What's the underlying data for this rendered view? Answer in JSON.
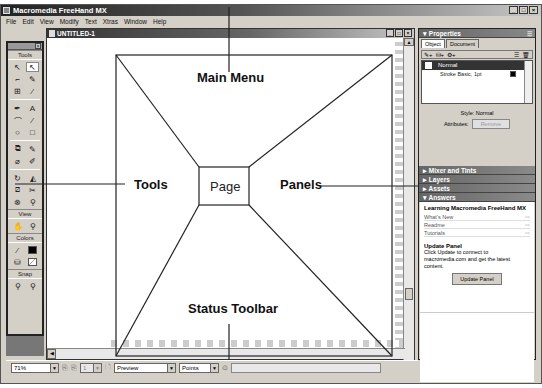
{
  "app": {
    "title": "Macromedia FreeHand MX",
    "window_buttons": [
      "_",
      "□",
      "×"
    ]
  },
  "menu": {
    "items": [
      "File",
      "Edit",
      "View",
      "Modify",
      "Text",
      "Xtras",
      "Window",
      "Help"
    ]
  },
  "document": {
    "title": "UNTITLED-1",
    "window_buttons": [
      "_",
      "□",
      "×"
    ]
  },
  "tools_panel": {
    "title": "Tools",
    "sections": [
      {
        "title": "Tools",
        "buttons": [
          {
            "icon": "pointer-icon",
            "glyph": "↖"
          },
          {
            "icon": "subselect-icon",
            "glyph": "⇱",
            "selected": true
          },
          {
            "icon": "page-tool-icon",
            "glyph": "⌐"
          },
          {
            "icon": "lasso-icon",
            "glyph": "✎"
          },
          {
            "icon": "scale-icon",
            "glyph": "⊞"
          },
          {
            "icon": "eyedropper-icon",
            "glyph": "⁄"
          },
          {
            "icon": "pen-icon",
            "glyph": "✒"
          },
          {
            "icon": "text-icon",
            "glyph": "A"
          },
          {
            "icon": "bezigon-icon",
            "glyph": "⌒"
          },
          {
            "icon": "line-icon",
            "glyph": "⁄"
          },
          {
            "icon": "ellipse-icon",
            "glyph": "○"
          },
          {
            "icon": "rectangle-icon",
            "glyph": "□"
          },
          {
            "icon": "trace-icon",
            "glyph": "⧉"
          },
          {
            "icon": "freeform-icon",
            "glyph": "✎"
          },
          {
            "icon": "eraser-icon",
            "glyph": "⌀"
          },
          {
            "icon": "brush-icon",
            "glyph": "✐"
          },
          {
            "icon": "rotate-icon",
            "glyph": "↻"
          },
          {
            "icon": "reflect-icon",
            "glyph": "◭"
          },
          {
            "icon": "skew-icon",
            "glyph": "⧄"
          },
          {
            "icon": "knife-icon",
            "glyph": "✂"
          },
          {
            "icon": "blend-icon",
            "glyph": "⊗"
          },
          {
            "icon": "chart-icon",
            "glyph": "⚲"
          }
        ]
      },
      {
        "title": "View",
        "buttons": [
          {
            "icon": "hand-icon",
            "glyph": "✋"
          },
          {
            "icon": "zoom-icon",
            "glyph": "⚲"
          }
        ]
      },
      {
        "title": "Colors",
        "buttons": [
          {
            "icon": "stroke-color-icon",
            "glyph": "⁄"
          },
          {
            "icon": "stroke-swatch-icon",
            "glyph": ""
          },
          {
            "icon": "fill-color-icon",
            "glyph": "⛁"
          },
          {
            "icon": "fill-swatch-icon",
            "glyph": ""
          }
        ]
      },
      {
        "title": "Snap",
        "buttons": [
          {
            "icon": "snap-to-point-icon",
            "glyph": "⚲"
          },
          {
            "icon": "snap-to-guide-icon",
            "glyph": "⚲"
          }
        ]
      }
    ]
  },
  "annotations": {
    "main_menu": "Main Menu",
    "tools": "Tools",
    "page": "Page",
    "panels": "Panels",
    "status_toolbar": "Status Toolbar"
  },
  "properties_panel": {
    "title": "Properties",
    "tabs": [
      "Object",
      "Document"
    ],
    "active_tab": "Object",
    "list": [
      {
        "label": "Normal",
        "selected": true
      },
      {
        "label": "Stroke Basic, 1pt",
        "selected": false
      }
    ],
    "style_label": "Style: Normal",
    "attributes_label": "Attributes:",
    "attributes_button": "Remove"
  },
  "collapsed_panels": [
    "Mixer and Tints",
    "Layers",
    "Assets"
  ],
  "answers_panel": {
    "title": "Answers",
    "heading": "Learning Macromedia FreeHand MX",
    "links": [
      "What's New",
      "Readme",
      "Tutorials"
    ],
    "update_title": "Update Panel",
    "update_text": "Click Update to connect to macromedia.com and get the latest content.",
    "update_button": "Update Panel"
  },
  "status_toolbar": {
    "zoom": "71%",
    "page_number": "1",
    "view_mode": "Preview",
    "units": "Points"
  }
}
